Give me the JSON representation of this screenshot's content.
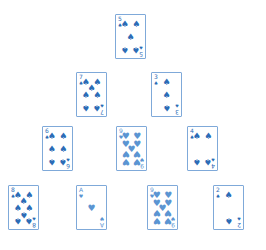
{
  "game": {
    "type": "pyramid-solitaire",
    "colors": {
      "card_border": "#7fa9d9",
      "spade": "#2c6cb6",
      "heart": "#5b95d2",
      "background": "#ffffff"
    },
    "rows": [
      [
        {
          "rank": "5",
          "suit": "spades",
          "glyph": "♠",
          "x": 115,
          "y": 14
        }
      ],
      [
        {
          "rank": "7",
          "suit": "spades",
          "glyph": "♠",
          "x": 76,
          "y": 72
        },
        {
          "rank": "3",
          "suit": "spades",
          "glyph": "♠",
          "x": 151,
          "y": 72
        }
      ],
      [
        {
          "rank": "6",
          "suit": "spades",
          "glyph": "♠",
          "x": 42,
          "y": 126
        },
        {
          "rank": "9",
          "suit": "hearts",
          "glyph": "♥",
          "x": 116,
          "y": 126
        },
        {
          "rank": "4",
          "suit": "spades",
          "glyph": "♠",
          "x": 187,
          "y": 126
        }
      ],
      [
        {
          "rank": "8",
          "suit": "spades",
          "glyph": "♠",
          "x": 8,
          "y": 185
        },
        {
          "rank": "A",
          "suit": "hearts",
          "glyph": "♥",
          "x": 76,
          "y": 185
        },
        {
          "rank": "9",
          "suit": "hearts",
          "glyph": "♥",
          "x": 147,
          "y": 185
        },
        {
          "rank": "2",
          "suit": "spades",
          "glyph": "♠",
          "x": 213,
          "y": 185
        }
      ]
    ]
  }
}
